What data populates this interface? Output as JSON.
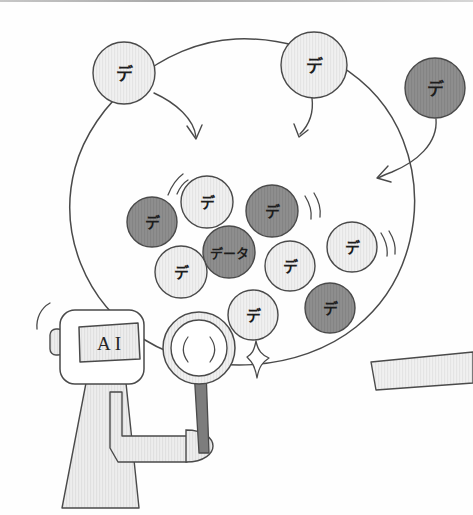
{
  "illustration": {
    "title": "AI analyzing data bubbles",
    "style": "hand-drawn sketch",
    "background_color": "#fefefe"
  },
  "palette": {
    "ink": "#4a4a4a",
    "ink_dark": "#3a3a3a",
    "bubble_light_fill": "#f0f0f0",
    "bubble_dark_fill": "#8e8e8e",
    "body_fill": "#ededed",
    "handle_fill": "#7d7d7d",
    "lens_fill": "#f2f2f2",
    "strip_fill": "#f2f2f2",
    "text_color": "#1d1d1d"
  },
  "robot": {
    "visor_label": "AI",
    "name": "ai-robot-character",
    "head_shape": "rounded-square",
    "has_ear_nub": true,
    "arm_holds": "magnifier"
  },
  "magnifier": {
    "name": "magnifying-glass",
    "lens_highlight_arcs": 2,
    "handle_color": "#7d7d7d"
  },
  "sparkle": {
    "name": "sparkle-icon",
    "points": 4
  },
  "big_circle": {
    "name": "data-pool-boundary",
    "label": ""
  },
  "incoming_bubbles": [
    {
      "id": "in-1",
      "label": "デ",
      "tone": "light",
      "cx": 124,
      "cy": 73,
      "r": 31
    },
    {
      "id": "in-2",
      "label": "デ",
      "tone": "light",
      "cx": 314,
      "cy": 65,
      "r": 33
    },
    {
      "id": "in-3",
      "label": "デ",
      "tone": "dark",
      "cx": 435,
      "cy": 88,
      "r": 30
    }
  ],
  "cluster_bubbles": [
    {
      "id": "c-1",
      "label": "デ",
      "tone": "dark",
      "cx": 152,
      "cy": 222,
      "r": 25
    },
    {
      "id": "c-2",
      "label": "デ",
      "tone": "light",
      "cx": 207,
      "cy": 202,
      "r": 26
    },
    {
      "id": "c-3",
      "label": "デ",
      "tone": "dark",
      "cx": 272,
      "cy": 211,
      "r": 26
    },
    {
      "id": "c-4",
      "label": "データ",
      "tone": "dark",
      "cx": 229,
      "cy": 252,
      "r": 26
    },
    {
      "id": "c-5",
      "label": "デ",
      "tone": "light",
      "cx": 181,
      "cy": 272,
      "r": 26
    },
    {
      "id": "c-6",
      "label": "デ",
      "tone": "light",
      "cx": 290,
      "cy": 266,
      "r": 25
    },
    {
      "id": "c-7",
      "label": "デ",
      "tone": "light",
      "cx": 352,
      "cy": 247,
      "r": 25
    },
    {
      "id": "c-8",
      "label": "デ",
      "tone": "light",
      "cx": 253,
      "cy": 315,
      "r": 25
    },
    {
      "id": "c-9",
      "label": "デ",
      "tone": "dark",
      "cx": 330,
      "cy": 308,
      "r": 25
    }
  ],
  "arrows": [
    {
      "id": "arrow-1",
      "name": "arrow-from-top-left-bubble",
      "direction": "down-right"
    },
    {
      "id": "arrow-2",
      "name": "arrow-from-top-center-bubble",
      "direction": "down"
    },
    {
      "id": "arrow-3",
      "name": "arrow-from-top-right-bubble",
      "direction": "down-left"
    }
  ],
  "motion_marks": [
    {
      "id": "mm-1",
      "name": "motion-mark-left",
      "arcs": 2
    },
    {
      "id": "mm-2",
      "name": "motion-mark-right-upper",
      "arcs": 2
    },
    {
      "id": "mm-3",
      "name": "motion-mark-right-lower",
      "arcs": 2
    },
    {
      "id": "mm-4",
      "name": "motion-mark-robot-head",
      "arcs": 1
    }
  ],
  "side_strip": {
    "name": "curved-strip",
    "label": ""
  }
}
